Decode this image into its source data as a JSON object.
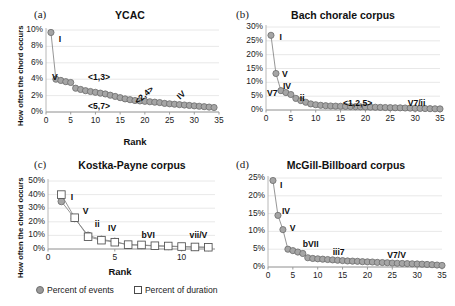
{
  "figure": {
    "legend": [
      {
        "marker": "filled-circle",
        "label": "Percent of events",
        "color": "#9a9a9a"
      },
      {
        "marker": "open-square",
        "label": "Percent of duration",
        "color": "#ffffff"
      }
    ]
  },
  "chart_data": [
    {
      "type": "line",
      "panel": "a",
      "panel_tag": "(a)",
      "title": "YCAC",
      "xlabel": "Rank",
      "ylabel": "How often the chord occurs",
      "xlim": [
        0,
        35
      ],
      "ylim": [
        0,
        0.1
      ],
      "xticks": [
        0,
        5,
        10,
        15,
        20,
        25,
        30,
        35
      ],
      "xticklabels": [
        "0",
        "5",
        "10",
        "15",
        "20",
        "25",
        "30",
        "35"
      ],
      "yticks": [
        0,
        0.02,
        0.04,
        0.06,
        0.08,
        0.1
      ],
      "yticklabels": [
        "0%",
        "2%",
        "4%",
        "6%",
        "8%",
        "10%"
      ],
      "grid": "horizontal",
      "series": [
        {
          "name": "Percent of events",
          "marker": "filled-circle",
          "x": [
            1,
            2,
            3,
            4,
            5,
            6,
            7,
            8,
            9,
            10,
            11,
            12,
            13,
            14,
            15,
            16,
            17,
            18,
            19,
            20,
            21,
            22,
            23,
            24,
            25,
            26,
            27,
            28,
            29,
            30,
            31,
            32,
            33,
            34
          ],
          "values": [
            9.7,
            4.0,
            3.85,
            3.7,
            3.6,
            2.9,
            2.75,
            2.6,
            2.5,
            2.4,
            2.3,
            2.2,
            2.05,
            1.9,
            1.75,
            1.6,
            1.5,
            1.4,
            1.35,
            1.3,
            1.25,
            1.2,
            1.15,
            1.05,
            1.0,
            0.95,
            0.9,
            0.85,
            0.8,
            0.75,
            0.7,
            0.65,
            0.6,
            0.55
          ]
        }
      ],
      "annotations": [
        {
          "text": "I",
          "x": 2.6,
          "y": 0.088,
          "rotation": 0
        },
        {
          "text": "V",
          "x": 1.2,
          "y": 0.042,
          "rotation": 0
        },
        {
          "text": "<1,3>",
          "x": 8.5,
          "y": 0.042,
          "rotation": 0
        },
        {
          "text": "<5,7>",
          "x": 8.5,
          "y": 0.006,
          "rotation": 0
        },
        {
          "text": "<2,4>",
          "x": 17.5,
          "y": 0.019,
          "rotation": -42
        },
        {
          "text": "IV",
          "x": 26.5,
          "y": 0.019,
          "rotation": -42
        }
      ]
    },
    {
      "type": "line",
      "panel": "b",
      "panel_tag": "(b)",
      "title": "Bach chorale corpus",
      "xlabel": "",
      "ylabel": "",
      "xlim": [
        0,
        35
      ],
      "ylim": [
        0,
        0.3
      ],
      "xticks": [
        0,
        5,
        10,
        15,
        20,
        25,
        30,
        35
      ],
      "xticklabels": [
        "0",
        "5",
        "10",
        "15",
        "20",
        "25",
        "30",
        "35"
      ],
      "yticks": [
        0,
        0.05,
        0.1,
        0.15,
        0.2,
        0.25,
        0.3
      ],
      "yticklabels": [
        "0%",
        "5%",
        "10%",
        "15%",
        "20%",
        "25%",
        "30%"
      ],
      "grid": "horizontal",
      "series": [
        {
          "name": "Percent of events",
          "marker": "filled-circle",
          "x": [
            1,
            2,
            3,
            4,
            5,
            6,
            7,
            8,
            9,
            10,
            11,
            12,
            13,
            14,
            15,
            16,
            17,
            18,
            19,
            20,
            21,
            22,
            23,
            24,
            25,
            26,
            27,
            28,
            29,
            30,
            31,
            32,
            33,
            34,
            35
          ],
          "values": [
            27.0,
            13.2,
            7.0,
            6.3,
            5.6,
            4.2,
            3.4,
            2.8,
            2.2,
            1.9,
            1.7,
            1.55,
            1.45,
            1.4,
            1.35,
            1.3,
            1.25,
            1.2,
            1.15,
            1.1,
            1.05,
            1.0,
            0.95,
            0.9,
            0.85,
            0.8,
            0.78,
            0.72,
            0.68,
            0.62,
            0.58,
            0.52,
            0.48,
            0.44,
            0.4
          ]
        }
      ],
      "annotations": [
        {
          "text": "I",
          "x": 2.7,
          "y": 0.262,
          "rotation": 0
        },
        {
          "text": "V",
          "x": 3.2,
          "y": 0.128,
          "rotation": 0
        },
        {
          "text": "V7",
          "x": 0.2,
          "y": 0.058,
          "rotation": 0
        },
        {
          "text": "IV",
          "x": 3.4,
          "y": 0.082,
          "rotation": 0
        },
        {
          "text": "ii",
          "x": 6.8,
          "y": 0.04,
          "rotation": 0
        },
        {
          "text": "<1,2,5>",
          "x": 15.5,
          "y": 0.022,
          "rotation": 0
        },
        {
          "text": "V7/ii",
          "x": 28.5,
          "y": 0.022,
          "rotation": 0
        }
      ]
    },
    {
      "type": "line",
      "panel": "c",
      "panel_tag": "(c)",
      "title": "Kostka-Payne corpus",
      "xlabel": "Rank",
      "ylabel": "How often the chord occurs",
      "xlim": [
        0,
        12.5
      ],
      "ylim": [
        0,
        0.5
      ],
      "xticks": [
        0,
        5,
        10
      ],
      "xticklabels": [
        "0",
        "5",
        "10"
      ],
      "yticks": [
        0,
        0.1,
        0.2,
        0.3,
        0.4,
        0.5
      ],
      "yticklabels": [
        "0%",
        "10%",
        "20%",
        "30%",
        "40%",
        "50%"
      ],
      "grid": "horizontal",
      "series": [
        {
          "name": "Percent of events",
          "marker": "filled-circle",
          "x": [
            1,
            2,
            3,
            4,
            5,
            6,
            7,
            8,
            9,
            10,
            11,
            12
          ],
          "values": [
            35.0,
            22.5,
            10.0,
            7.0,
            5.5,
            3.0,
            2.8,
            2.2,
            2.0,
            1.6,
            1.4,
            1.2
          ]
        },
        {
          "name": "Percent of duration",
          "marker": "open-square",
          "x": [
            1,
            2,
            3,
            4,
            5,
            6,
            7,
            8,
            9,
            10,
            11,
            12
          ],
          "values": [
            40.0,
            23.0,
            9.0,
            6.5,
            5.0,
            3.2,
            3.0,
            2.4,
            2.2,
            1.8,
            1.5,
            1.3
          ]
        }
      ],
      "annotations": [
        {
          "text": "I",
          "x": 1.7,
          "y": 0.375,
          "rotation": 0
        },
        {
          "text": "V",
          "x": 2.6,
          "y": 0.275,
          "rotation": 0
        },
        {
          "text": "ii",
          "x": 3.5,
          "y": 0.175,
          "rotation": 0
        },
        {
          "text": "IV",
          "x": 4.5,
          "y": 0.145,
          "rotation": 0
        },
        {
          "text": "bVI",
          "x": 7.0,
          "y": 0.095,
          "rotation": 0
        },
        {
          "text": "vii/V",
          "x": 10.6,
          "y": 0.095,
          "rotation": 0
        }
      ]
    },
    {
      "type": "line",
      "panel": "d",
      "panel_tag": "(d)",
      "title": "McGill-Billboard corpus",
      "xlabel": "",
      "ylabel": "",
      "xlim": [
        0,
        35
      ],
      "ylim": [
        0,
        0.25
      ],
      "xticks": [
        0,
        5,
        10,
        15,
        20,
        25,
        30,
        35
      ],
      "xticklabels": [
        "0",
        "5",
        "10",
        "15",
        "20",
        "25",
        "30",
        "35"
      ],
      "yticks": [
        0,
        0.05,
        0.1,
        0.15,
        0.2,
        0.25
      ],
      "yticklabels": [
        "0%",
        "5%",
        "10%",
        "15%",
        "20%",
        "25%"
      ],
      "grid": "horizontal",
      "series": [
        {
          "name": "Percent of events",
          "marker": "filled-circle",
          "x": [
            1,
            2,
            3,
            4,
            5,
            6,
            7,
            8,
            9,
            10,
            11,
            12,
            13,
            14,
            15,
            16,
            17,
            18,
            19,
            20,
            21,
            22,
            23,
            24,
            25,
            26,
            27,
            28,
            29,
            30,
            31,
            32,
            33,
            34,
            35
          ],
          "values": [
            24.3,
            14.5,
            10.5,
            5.0,
            4.6,
            4.2,
            3.8,
            2.6,
            2.4,
            2.3,
            2.2,
            2.1,
            2.0,
            1.9,
            1.8,
            1.7,
            1.65,
            1.6,
            1.5,
            1.45,
            1.4,
            1.3,
            1.25,
            1.2,
            1.1,
            1.05,
            1.0,
            0.95,
            0.9,
            0.85,
            0.8,
            0.72,
            0.65,
            0.55,
            0.45
          ]
        }
      ],
      "annotations": [
        {
          "text": "I",
          "x": 2.4,
          "y": 0.228,
          "rotation": 0
        },
        {
          "text": "IV",
          "x": 2.8,
          "y": 0.155,
          "rotation": 0
        },
        {
          "text": "V",
          "x": 4.4,
          "y": 0.108,
          "rotation": 0
        },
        {
          "text": "bVII",
          "x": 7.0,
          "y": 0.062,
          "rotation": 0
        },
        {
          "text": "iii7",
          "x": 13.0,
          "y": 0.038,
          "rotation": 0
        },
        {
          "text": "V7/V",
          "x": 24.0,
          "y": 0.032,
          "rotation": 0
        }
      ]
    }
  ]
}
